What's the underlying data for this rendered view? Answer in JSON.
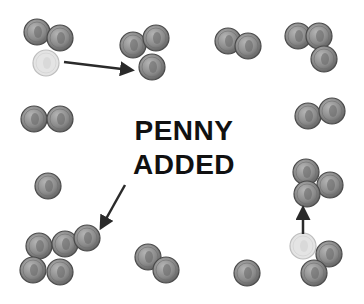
{
  "caption": {
    "line1": "PENNY",
    "line2": "ADDED"
  },
  "colors": {
    "coin_fill": "#8a8a8a",
    "coin_edge": "#4a4a4a",
    "coin_faded": "#e4e4e4",
    "arrow": "#2a2a2a",
    "text": "#111111"
  },
  "coin_radius": 13,
  "coins": [
    {
      "x": 37,
      "y": 32,
      "faded": false
    },
    {
      "x": 60,
      "y": 38,
      "faded": false
    },
    {
      "x": 46,
      "y": 63,
      "faded": true
    },
    {
      "x": 133,
      "y": 45,
      "faded": false
    },
    {
      "x": 156,
      "y": 38,
      "faded": false
    },
    {
      "x": 152,
      "y": 67,
      "faded": false
    },
    {
      "x": 228,
      "y": 41,
      "faded": false
    },
    {
      "x": 248,
      "y": 46,
      "faded": false
    },
    {
      "x": 298,
      "y": 36,
      "faded": false
    },
    {
      "x": 319,
      "y": 36,
      "faded": false
    },
    {
      "x": 324,
      "y": 59,
      "faded": false
    },
    {
      "x": 34,
      "y": 119,
      "faded": false
    },
    {
      "x": 60,
      "y": 119,
      "faded": false
    },
    {
      "x": 308,
      "y": 116,
      "faded": false
    },
    {
      "x": 332,
      "y": 111,
      "faded": false
    },
    {
      "x": 48,
      "y": 186,
      "faded": false
    },
    {
      "x": 306,
      "y": 172,
      "faded": false
    },
    {
      "x": 330,
      "y": 185,
      "faded": false
    },
    {
      "x": 307,
      "y": 194,
      "faded": false
    },
    {
      "x": 39,
      "y": 246,
      "faded": false
    },
    {
      "x": 65,
      "y": 244,
      "faded": false
    },
    {
      "x": 87,
      "y": 238,
      "faded": false
    },
    {
      "x": 33,
      "y": 270,
      "faded": false
    },
    {
      "x": 60,
      "y": 272,
      "faded": false
    },
    {
      "x": 148,
      "y": 257,
      "faded": false
    },
    {
      "x": 166,
      "y": 270,
      "faded": false
    },
    {
      "x": 247,
      "y": 273,
      "faded": false
    },
    {
      "x": 303,
      "y": 246,
      "faded": true
    },
    {
      "x": 329,
      "y": 254,
      "faded": false
    },
    {
      "x": 314,
      "y": 273,
      "faded": false
    }
  ],
  "arrows": [
    {
      "x1": 64,
      "y1": 62,
      "x2": 130,
      "y2": 70
    },
    {
      "x1": 125,
      "y1": 185,
      "x2": 102,
      "y2": 226
    },
    {
      "x1": 303,
      "y1": 234,
      "x2": 303,
      "y2": 210
    }
  ]
}
